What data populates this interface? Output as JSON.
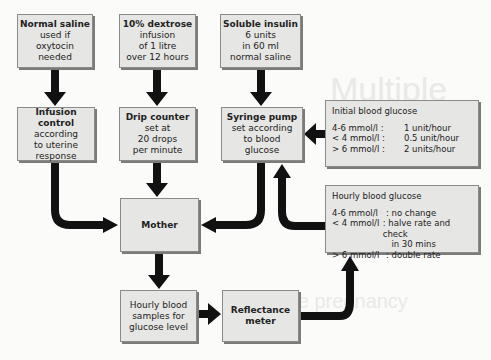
{
  "background_text": {
    "line1": "Multiple",
    "line2": "pregnancy",
    "line3": "multiple pregnancy"
  },
  "boxes": {
    "normal_saline": {
      "title": "Normal saline",
      "lines": [
        "used if oxytocin",
        "needed"
      ]
    },
    "dextrose": {
      "title": "10% dextrose",
      "lines": [
        "infusion",
        "of 1 litre",
        "over 12 hours"
      ]
    },
    "insulin": {
      "title": "Soluble insulin",
      "lines": [
        "6 units",
        "in 60 ml",
        "normal saline"
      ]
    },
    "infusion_control": {
      "title": "Infusion control",
      "lines": [
        "according",
        "to uterine",
        "response"
      ]
    },
    "drip_counter": {
      "title": "Drip counter",
      "lines": [
        "set at",
        "20 drops",
        "per minute"
      ]
    },
    "syringe_pump": {
      "title": "Syringe pump",
      "lines": [
        "set according",
        "to blood",
        "glucose"
      ]
    },
    "mother": {
      "title": "Mother"
    },
    "hourly_samples": {
      "lines": [
        "Hourly blood",
        "samples for",
        "glucose level"
      ]
    },
    "reflectance_meter": {
      "title": "Reflectance",
      "lines": [
        "meter"
      ]
    }
  },
  "panels": {
    "initial": {
      "title": "Initial blood glucose",
      "rows": [
        {
          "range": "4-6 mmol/l  :",
          "action": "1 unit/hour"
        },
        {
          "range": "< 4 mmol/l  :",
          "action": "0.5 unit/hour"
        },
        {
          "range": "> 6 mmol/l  :",
          "action": "2 units/hour"
        }
      ]
    },
    "hourly": {
      "title": "Hourly blood glucose",
      "rows": [
        {
          "range": "4-6 mmol/l",
          "action": ": no change"
        },
        {
          "range": "< 4 mmol/l",
          "action": ": halve rate and check"
        },
        {
          "range": "",
          "action": "  in 30 mins"
        },
        {
          "range": "> 6 mmol/l",
          "action": ": double rate"
        }
      ]
    }
  },
  "colors": {
    "box_fill": "#e6e6e4",
    "box_border": "#8a8a88",
    "arrow": "#111111",
    "background": "#fbfbfa"
  }
}
